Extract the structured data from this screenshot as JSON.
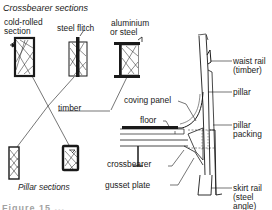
{
  "diagram": {
    "title_top": "Crossbearer sections",
    "title_bottom": "Pillar sections",
    "crossbearer_sections": [
      {
        "label_line1": "cold-rolled",
        "label_line2": "section"
      },
      {
        "label_line1": "steel flitch"
      },
      {
        "label_line1": "aluminium",
        "label_line2": "or steel"
      }
    ],
    "labels": {
      "timber": "timber",
      "coving_panel": "coving panel",
      "floor": "floor",
      "crossbearer": "crossbearer",
      "gusset_plate": "gusset plate",
      "waist_rail_line1": "waist rail",
      "waist_rail_line2": "(timber)",
      "pillar": "pillar",
      "pillar_packing_line1": "pillar",
      "pillar_packing_line2": "packing",
      "skirt_rail_line1": "skirt rail",
      "skirt_rail_line2": "(steel",
      "skirt_rail_line3": "angle)"
    },
    "caption_partial": "Figure 15 ..."
  }
}
